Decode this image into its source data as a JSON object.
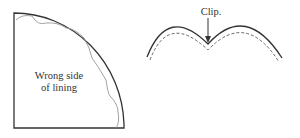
{
  "left_figure": {
    "label_line1": "Wrong side",
    "label_line2": "of lining"
  },
  "right_figure": {
    "annotation": "Clip."
  },
  "colors": {
    "outline": "#333333",
    "scallop": "#888888"
  }
}
